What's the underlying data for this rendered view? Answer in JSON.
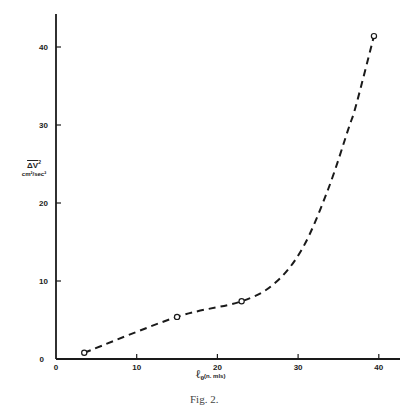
{
  "chart_data": {
    "type": "line",
    "title": "",
    "caption": "Fig. 2.",
    "xlabel": "ℓ₀ (n. mls)",
    "ylabel": "ΔV² cm²/sec²",
    "ylabel_top": "ΔV²",
    "ylabel_bottom": "cm²/sec²",
    "xlim": [
      0,
      43
    ],
    "ylim": [
      0,
      44
    ],
    "xticks": [
      0,
      10,
      20,
      30,
      40
    ],
    "yticks": [
      0,
      10,
      20,
      30,
      40
    ],
    "grid": false,
    "legend": null,
    "series": [
      {
        "name": "observed",
        "marker": "open-circle",
        "line": "dashed smooth curve",
        "x": [
          3.5,
          15,
          23,
          39.4
        ],
        "y": [
          0.8,
          5.4,
          7.4,
          41.4
        ]
      }
    ]
  },
  "labels": {
    "caption": "Fig. 2.",
    "x_main": "ℓ₀",
    "x_unit": "(n. mls)",
    "y_top": "ΔV",
    "y_sup": "2",
    "y_bottom": "cm²/sec²"
  }
}
